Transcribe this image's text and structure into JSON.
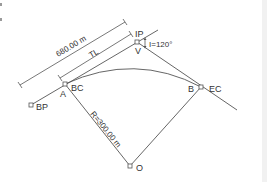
{
  "diagram": {
    "type": "horizontal-curve",
    "labels": {
      "ip": "IP",
      "v": "V",
      "angle": "I=120°",
      "outer_dim": "680.00 m",
      "tl": "TL",
      "bc": "BC",
      "a": "A",
      "bp": "BP",
      "b": "B",
      "ec": "EC",
      "radius": "R=300.00 m",
      "o": "O"
    },
    "points": {
      "BP": [
        31,
        105
      ],
      "A_BC": [
        65,
        84
      ],
      "IP_V": [
        137,
        42
      ],
      "B_EC": [
        201,
        87
      ],
      "O": [
        130,
        166
      ]
    },
    "colors": {
      "line": "#555555",
      "text": "#333333",
      "background": "#ffffff"
    }
  }
}
